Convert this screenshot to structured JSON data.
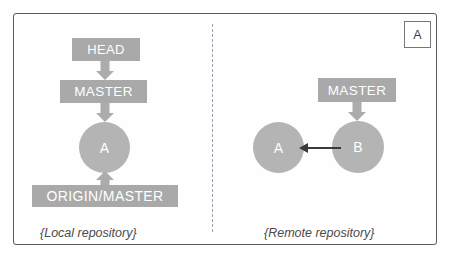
{
  "diagram": {
    "corner_badge_label": "A",
    "divider_style": "dashed",
    "colors": {
      "box_fill": "#a9a9a9",
      "circle_fill": "#b4b4b4",
      "box_text": "#ffffff",
      "arrow_gray": "#acacac",
      "arrow_dark": "#3a3a3a",
      "frame_border": "#5a5a5a",
      "divider": "#9aa0b0",
      "caption_text": "#4a4a4a",
      "background": "#fefefe"
    }
  },
  "local_panel": {
    "caption": "{Local repository}",
    "head_label": "HEAD",
    "master_label": "MASTER",
    "origin_master_label": "ORIGIN/MASTER",
    "commit_label": "A"
  },
  "remote_panel": {
    "caption": "{Remote repository}",
    "master_label": "MASTER",
    "commit_a_label": "A",
    "commit_b_label": "B"
  }
}
